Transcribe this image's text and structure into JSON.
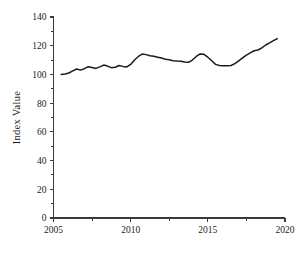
{
  "chart_data": {
    "type": "line",
    "title": "",
    "xlabel": "",
    "ylabel": "Index Value",
    "xlim": [
      2005,
      2020
    ],
    "ylim": [
      0,
      140
    ],
    "grid": false,
    "legend": false,
    "x_ticks": [
      2005,
      2010,
      2015,
      2020
    ],
    "x_tick_labels": [
      "2005",
      "2010",
      "2015",
      "2020"
    ],
    "x_minor_ticks": [
      2007.5,
      2012.5,
      2017.5
    ],
    "y_ticks": [
      0,
      20,
      40,
      60,
      80,
      100,
      120,
      140
    ],
    "y_tick_labels": [
      "0",
      "20",
      "40",
      "60",
      "80",
      "100",
      "120",
      "140"
    ],
    "y_minor_ticks": [
      10,
      30,
      50,
      70,
      90,
      110,
      130
    ],
    "line_color": "#1b1b1b",
    "axis_color": "#3a3a3a",
    "background_color": "#ffffff",
    "series": [
      {
        "name": "Index Value",
        "x": [
          2005.5,
          2005.75,
          2006.0,
          2006.25,
          2006.5,
          2006.75,
          2007.0,
          2007.25,
          2007.5,
          2007.75,
          2008.0,
          2008.25,
          2008.5,
          2008.75,
          2009.0,
          2009.25,
          2009.5,
          2009.75,
          2010.0,
          2010.25,
          2010.5,
          2010.75,
          2011.0,
          2011.25,
          2011.5,
          2011.75,
          2012.0,
          2012.25,
          2012.5,
          2012.75,
          2013.0,
          2013.25,
          2013.5,
          2013.75,
          2014.0,
          2014.25,
          2014.5,
          2014.75,
          2015.0,
          2015.25,
          2015.5,
          2015.75,
          2016.0,
          2016.25,
          2016.5,
          2016.75,
          2017.0,
          2017.25,
          2017.5,
          2017.75,
          2018.0,
          2018.25,
          2018.5,
          2018.75,
          2019.0,
          2019.25,
          2019.5
        ],
        "y": [
          100.0,
          100.3,
          101.0,
          102.5,
          103.8,
          103.0,
          104.0,
          105.4,
          104.8,
          104.2,
          105.3,
          106.5,
          105.8,
          104.7,
          105.0,
          106.2,
          105.6,
          105.2,
          107.0,
          110.0,
          112.5,
          114.2,
          113.8,
          113.0,
          112.6,
          112.0,
          111.4,
          110.6,
          110.2,
          109.6,
          109.3,
          109.2,
          108.6,
          108.4,
          110.0,
          112.5,
          114.3,
          114.0,
          112.0,
          109.5,
          107.0,
          106.2,
          106.0,
          106.0,
          106.2,
          107.5,
          109.5,
          111.5,
          113.5,
          115.0,
          116.5,
          117.0,
          118.5,
          120.5,
          122.0,
          123.5,
          125.0
        ]
      }
    ]
  },
  "axes": {
    "ylabel": "Index Value"
  }
}
